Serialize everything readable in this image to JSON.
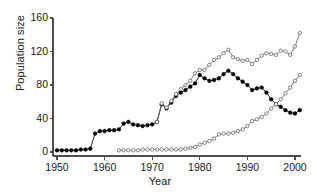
{
  "chart_data": {
    "type": "line",
    "title": "",
    "xlabel": "Year",
    "ylabel": "Population size",
    "xlim": [
      1949,
      2002
    ],
    "ylim": [
      0,
      160
    ],
    "xticks": [
      1950,
      1960,
      1970,
      1980,
      1990,
      2000
    ],
    "yticks": [
      0,
      40,
      80,
      120,
      160
    ],
    "grid": false,
    "legend": "none",
    "series": [
      {
        "name": "series-filled-circles",
        "marker": "filled-circle",
        "color": "#000000",
        "line_color": "#000000",
        "x": [
          1950,
          1951,
          1952,
          1953,
          1954,
          1955,
          1956,
          1957,
          1958,
          1959,
          1960,
          1961,
          1962,
          1963,
          1964,
          1965,
          1966,
          1967,
          1968,
          1969,
          1970,
          1971,
          1972,
          1973,
          1974,
          1975,
          1976,
          1977,
          1978,
          1979,
          1980,
          1981,
          1982,
          1983,
          1984,
          1985,
          1986,
          1987,
          1988,
          1989,
          1990,
          1991,
          1992,
          1993,
          1994,
          1995,
          1996,
          1997,
          1998,
          1999,
          2000,
          2001
        ],
        "y": [
          2,
          2,
          2,
          2,
          2,
          3,
          3,
          4,
          22,
          25,
          25,
          26,
          26,
          27,
          34,
          36,
          33,
          32,
          31,
          32,
          33,
          36,
          57,
          52,
          59,
          67,
          71,
          74,
          78,
          82,
          92,
          88,
          85,
          86,
          88,
          93,
          97,
          93,
          88,
          84,
          80,
          74,
          76,
          77,
          71,
          63,
          57,
          54,
          50,
          47,
          46,
          50
        ]
      },
      {
        "name": "series-open-circles-upper",
        "marker": "open-circle",
        "color": "#666666",
        "line_color": "#666666",
        "x": [
          1971,
          1972,
          1973,
          1974,
          1975,
          1976,
          1977,
          1978,
          1979,
          1980,
          1981,
          1982,
          1983,
          1984,
          1985,
          1986,
          1987,
          1988,
          1989,
          1990,
          1991,
          1992,
          1993,
          1994,
          1995,
          1996,
          1997,
          1998,
          1999,
          2000,
          2001
        ],
        "y": [
          36,
          58,
          53,
          61,
          69,
          75,
          80,
          85,
          94,
          98,
          98,
          104,
          110,
          113,
          118,
          122,
          113,
          111,
          109,
          110,
          105,
          110,
          115,
          118,
          117,
          116,
          121,
          120,
          116,
          126,
          142
        ]
      },
      {
        "name": "series-open-circles-lower",
        "marker": "open-circle",
        "color": "#666666",
        "line_color": "#666666",
        "x": [
          1963,
          1964,
          1965,
          1966,
          1967,
          1968,
          1969,
          1970,
          1971,
          1972,
          1973,
          1974,
          1975,
          1976,
          1977,
          1978,
          1979,
          1980,
          1981,
          1982,
          1983,
          1984,
          1985,
          1986,
          1987,
          1988,
          1989,
          1990,
          1991,
          1992,
          1993,
          1994,
          1995,
          1996,
          1997,
          1998,
          1999,
          2000,
          2001
        ],
        "y": [
          2,
          2,
          2,
          2,
          2,
          3,
          3,
          3,
          3,
          3,
          3,
          3,
          3,
          3,
          4,
          5,
          6,
          9,
          11,
          13,
          16,
          21,
          22,
          22,
          23,
          25,
          27,
          31,
          37,
          39,
          42,
          46,
          52,
          57,
          63,
          70,
          77,
          85,
          92
        ]
      }
    ]
  },
  "axis": {
    "ylabel_text": "Population size",
    "xlabel_text": "Year",
    "ytick_labels": [
      "0",
      "40",
      "80",
      "120",
      "160"
    ],
    "xtick_labels": [
      "1950",
      "1960",
      "1970",
      "1980",
      "1990",
      "2000"
    ]
  },
  "colors": {
    "axis": "#4d4d4d",
    "text": "#1a1a1a",
    "series_filled": "#000000",
    "series_open": "#666666"
  }
}
